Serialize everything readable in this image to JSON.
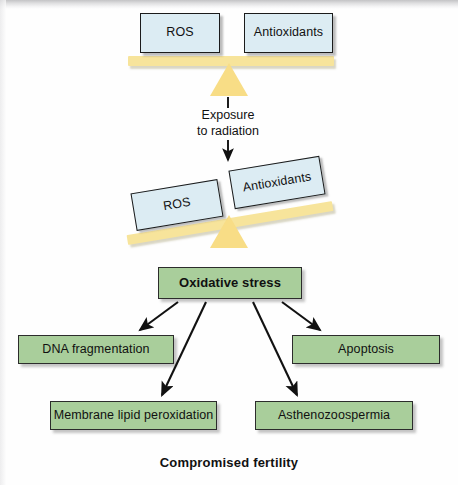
{
  "figure": {
    "caption": "Compromised fertility",
    "exposure_label": "Exposure\nto radiation",
    "exposure_line1": "Exposure",
    "exposure_line2": "to radiation"
  },
  "balance_top": {
    "left_box": "ROS",
    "right_box": "Antioxidants",
    "state": "balanced"
  },
  "balance_tilted": {
    "left_box": "ROS",
    "right_box": "Antioxidants",
    "state": "tilted-left",
    "tilt_degrees": -9.4
  },
  "outcome": {
    "main": "Oxidative stress",
    "effects": [
      "DNA fragmentation",
      "Membrane lipid peroxidation",
      "Asthenozoospermia",
      "Apoptosis"
    ]
  },
  "colors": {
    "box_blue_fill": "#dcecf3",
    "box_green_fill": "#a9ce9b",
    "beam_yellow": "#f7e49b",
    "fulcrum_yellow": "#f8dd86",
    "border": "#1b1b1b",
    "arrow": "#111111",
    "background": "#fefefe"
  }
}
